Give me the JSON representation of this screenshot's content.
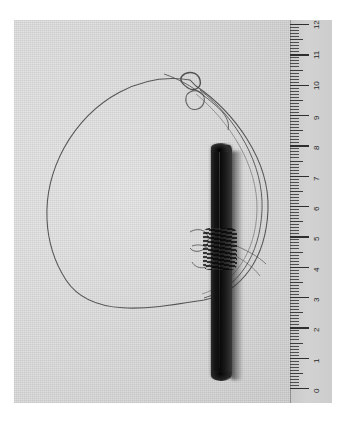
{
  "image": {
    "kind": "photograph",
    "subject": "archaeological artifact: dark wooden rod with thin wire cord loop",
    "alt": "Grayscale photograph of a dark slender rod lying beside a coiled thin wire loop, with a centimetre ruler along the right edge",
    "background_color": "#d8d8d8",
    "page_color": "#ffffff",
    "artifact_color": "#0f0f0f",
    "wire_color": "#4a4a4a",
    "ruler_color": "#cdcdcd"
  },
  "objects": {
    "rod_label": "dark rod",
    "wire_loop_label": "wire loop",
    "knot_label": "knot",
    "binding_label": "cord binding"
  },
  "ruler": {
    "unit": "cm",
    "min": 0,
    "max": 12,
    "orientation": "vertical",
    "zero_at": "bottom",
    "numbers": [
      "0",
      "1",
      "2",
      "3",
      "4",
      "5",
      "6",
      "7",
      "8",
      "9",
      "10",
      "11",
      "12"
    ]
  }
}
